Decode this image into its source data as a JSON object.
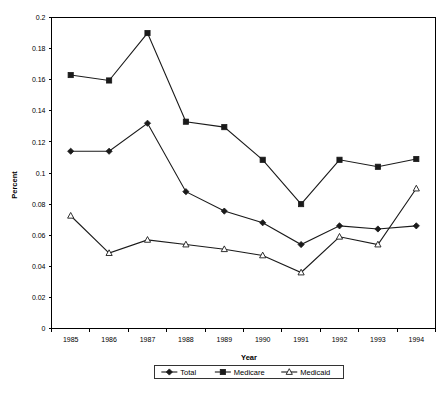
{
  "figure": {
    "plot_border": "#000000",
    "series_color": "#1a1a1a",
    "background": "#ffffff"
  },
  "axes": {
    "y_title": "Percent",
    "x_title": "Year",
    "y_ticks": [
      "0",
      "0.02",
      "0.04",
      "0.06",
      "0.08",
      "0.1",
      "0.12",
      "0.14",
      "0.16",
      "0.18",
      "0.2"
    ],
    "x_ticks": [
      "1985",
      "1986",
      "1987",
      "1988",
      "1989",
      "1990",
      "1991",
      "1992",
      "1993",
      "1994"
    ]
  },
  "legend": {
    "items": [
      {
        "label": "Total",
        "marker": "diamond-filled"
      },
      {
        "label": "Medicare",
        "marker": "square-filled"
      },
      {
        "label": "Medicaid",
        "marker": "triangle-open"
      }
    ]
  },
  "chart_data": {
    "type": "line",
    "title": "",
    "xlabel": "Year",
    "ylabel": "Percent",
    "categories": [
      "1985",
      "1986",
      "1987",
      "1988",
      "1989",
      "1990",
      "1991",
      "1992",
      "1993",
      "1994"
    ],
    "x": [
      1985,
      1986,
      1987,
      1988,
      1989,
      1990,
      1991,
      1992,
      1993,
      1994
    ],
    "ylim": [
      0,
      0.2
    ],
    "ytick_step": 0.02,
    "grid": false,
    "legend_position": "bottom",
    "series": [
      {
        "name": "Total",
        "marker": "diamond-filled",
        "values": [
          0.114,
          0.114,
          0.132,
          0.088,
          0.0755,
          0.068,
          0.054,
          0.066,
          0.064,
          0.066
        ]
      },
      {
        "name": "Medicare",
        "marker": "square-filled",
        "values": [
          0.163,
          0.1595,
          0.19,
          0.133,
          0.1295,
          0.1085,
          0.08,
          0.1085,
          0.104,
          0.109
        ]
      },
      {
        "name": "Medicaid",
        "marker": "triangle-open",
        "values": [
          0.0725,
          0.0485,
          0.057,
          0.054,
          0.051,
          0.047,
          0.036,
          0.059,
          0.054,
          0.09
        ]
      }
    ]
  }
}
